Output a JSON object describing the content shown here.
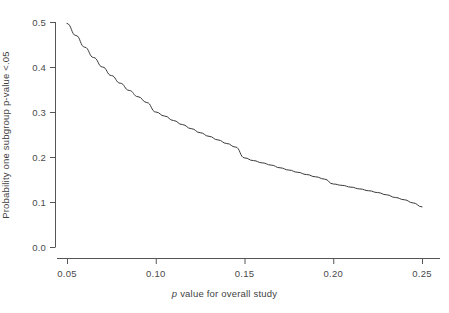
{
  "chart_data": {
    "type": "line",
    "title": "",
    "subtitle": "",
    "xlabel_parts": {
      "italic": "p",
      "rest": " value for overall study"
    },
    "xlabel": "p value for overall study",
    "ylabel": "Probability one subgroup p-value <.05",
    "xlim": [
      0.037,
      0.262
    ],
    "ylim": [
      0.0,
      0.52
    ],
    "xticks": [
      0.05,
      0.1,
      0.15,
      0.2,
      0.25
    ],
    "xtick_labels": [
      "0.05",
      "0.10",
      "0.15",
      "0.20",
      "0.25"
    ],
    "yticks": [
      0.0,
      0.1,
      0.2,
      0.3,
      0.4,
      0.5
    ],
    "ytick_labels": [
      "0.0",
      "0.1",
      "0.2",
      "0.3",
      "0.4",
      "0.5"
    ],
    "grid": false,
    "legend": null,
    "line_color": "#3a3a3a",
    "line_width": 1.0,
    "axis_color": "#555555",
    "background": "#ffffff",
    "x": [
      0.05,
      0.055,
      0.06,
      0.065,
      0.07,
      0.075,
      0.08,
      0.085,
      0.09,
      0.095,
      0.1,
      0.105,
      0.11,
      0.115,
      0.12,
      0.125,
      0.13,
      0.135,
      0.14,
      0.145,
      0.15,
      0.155,
      0.16,
      0.165,
      0.17,
      0.175,
      0.18,
      0.185,
      0.19,
      0.195,
      0.2,
      0.205,
      0.21,
      0.215,
      0.22,
      0.225,
      0.23,
      0.235,
      0.24,
      0.245,
      0.25
    ],
    "values": [
      0.497,
      0.47,
      0.444,
      0.421,
      0.4,
      0.381,
      0.364,
      0.348,
      0.334,
      0.321,
      0.3,
      0.291,
      0.281,
      0.272,
      0.263,
      0.254,
      0.246,
      0.238,
      0.23,
      0.222,
      0.198,
      0.192,
      0.187,
      0.182,
      0.176,
      0.171,
      0.166,
      0.161,
      0.156,
      0.151,
      0.14,
      0.137,
      0.133,
      0.129,
      0.125,
      0.121,
      0.116,
      0.11,
      0.105,
      0.098,
      0.089
    ],
    "series": [
      {
        "name": "Probability one subgroup p-value <.05",
        "values": [
          0.497,
          0.47,
          0.444,
          0.421,
          0.4,
          0.381,
          0.364,
          0.348,
          0.334,
          0.321,
          0.3,
          0.291,
          0.281,
          0.272,
          0.263,
          0.254,
          0.246,
          0.238,
          0.23,
          0.222,
          0.198,
          0.192,
          0.187,
          0.182,
          0.176,
          0.171,
          0.166,
          0.161,
          0.156,
          0.151,
          0.14,
          0.137,
          0.133,
          0.129,
          0.125,
          0.121,
          0.116,
          0.11,
          0.105,
          0.098,
          0.089
        ]
      }
    ],
    "annotations": []
  }
}
